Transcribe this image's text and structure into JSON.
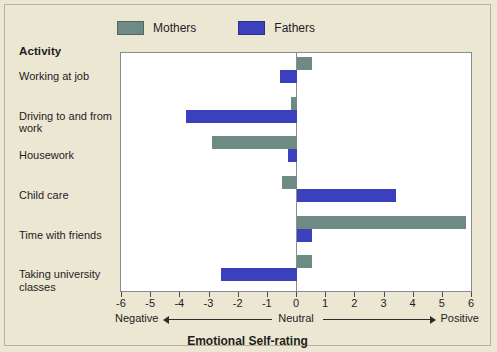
{
  "legend": {
    "items": [
      {
        "label": "Mothers",
        "color": "#6e8a84",
        "icon": "legend-swatch"
      },
      {
        "label": "Fathers",
        "color": "#3b41bd",
        "icon": "legend-swatch"
      }
    ]
  },
  "activity_header": "Activity",
  "polarity": {
    "negative": "Negative",
    "neutral": "Neutral",
    "positive": "Positive"
  },
  "chart_data": {
    "type": "bar",
    "orientation": "horizontal",
    "title": "",
    "xlabel": "Emotional Self-rating",
    "ylabel": "Activity",
    "xlim": [
      -6,
      6
    ],
    "xticks": [
      -6,
      -5,
      -4,
      -3,
      -2,
      -1,
      0,
      1,
      2,
      3,
      4,
      5,
      6
    ],
    "xticklabels": [
      "-6",
      "-5",
      "-4",
      "-3",
      "-2",
      "-1",
      "0",
      "1",
      "2",
      "3",
      "4",
      "5",
      "6"
    ],
    "grid": false,
    "zero_line": true,
    "legend_position": "top",
    "categories": [
      "Working at job",
      "Driving to and from work",
      "Housework",
      "Child care",
      "Time with friends",
      "Taking university classes"
    ],
    "series": [
      {
        "name": "Mothers",
        "color": "#6e8a84",
        "values": [
          0.5,
          -0.2,
          -2.9,
          -0.5,
          5.8,
          0.5
        ]
      },
      {
        "name": "Fathers",
        "color": "#3b41bd",
        "values": [
          -0.6,
          -3.8,
          -0.3,
          3.4,
          0.5,
          -2.6
        ]
      }
    ]
  }
}
